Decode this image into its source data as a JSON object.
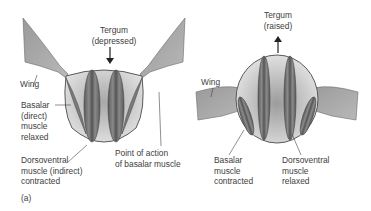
{
  "panel_label": "(a)",
  "left_diagram": {
    "tergum_label": "Tergum\n(depressed)",
    "wing_label": "Wing",
    "basalar_label": "Basalar\n(direct)\nmuscle\nrelaxed",
    "dorsoventral_label": "Dorsoventral\nmuscle (indirect)\ncontracted",
    "point_of_action_label": "Point of action\nof basalar muscle",
    "arrow_direction": "down"
  },
  "right_diagram": {
    "tergum_label": "Tergum\n(raised)",
    "wing_label": "Wing",
    "basalar_label": "Basalar\nmuscle\ncontracted",
    "dorsoventral_label": "Dorsoventral\nmuscle\nrelaxed",
    "arrow_direction": "up"
  },
  "colors": {
    "body_fill": "#d6d6d6",
    "body_dark": "#9a9a9a",
    "muscle_fill": "#6e6e6e",
    "muscle_stripe": "#4a4a4a",
    "wing_fill": "#a8a8a8",
    "outline": "#5a5a5a",
    "text": "#404040"
  }
}
